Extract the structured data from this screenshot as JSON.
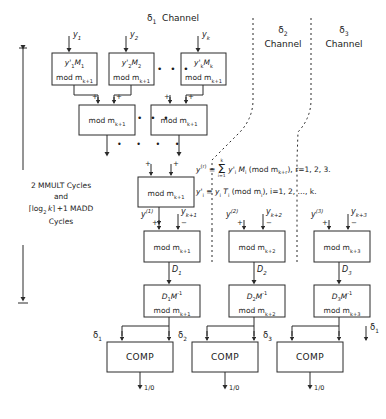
{
  "figure": {
    "type": "block-diagram",
    "headers": [
      {
        "name": "channel-1-header",
        "symbol": "δ",
        "sub": "1",
        "word": "Channel"
      },
      {
        "name": "channel-2-header",
        "symbol": "δ",
        "sub": "2",
        "word": "Channel"
      },
      {
        "name": "channel-3-header",
        "symbol": "δ",
        "sub": "3",
        "word": "Channel"
      }
    ],
    "inputs_top": [
      {
        "base": "y",
        "sub": "1"
      },
      {
        "base": "y",
        "sub": "2"
      },
      {
        "base": "y",
        "sub": "k"
      }
    ],
    "mmult_boxes": [
      {
        "line1_num": "y'",
        "line1_sub": "1",
        "line1_mul": "M",
        "line1_mulsub": "1",
        "line2": "mod m",
        "line2_sub": "k+1"
      },
      {
        "line1_num": "y'",
        "line1_sub": "2",
        "line1_mul": "M",
        "line1_mulsub": "2",
        "line2": "mod m",
        "line2_sub": "k+1"
      },
      {
        "line1_num": "y'",
        "line1_sub": "k",
        "line1_mul": "M",
        "line1_mulsub": "k",
        "line2": "mod m",
        "line2_sub": "k+1"
      }
    ],
    "adder_row2": [
      {
        "label": "mod m",
        "sub": "k+1"
      },
      {
        "label": "mod m",
        "sub": "k+1"
      }
    ],
    "adder_row3": {
      "label": "mod m",
      "sub": "k+1"
    },
    "subtract_boxes": [
      {
        "label": "mod m",
        "sub": "k+1"
      },
      {
        "label": "mod m",
        "sub": "k+2"
      },
      {
        "label": "mod m",
        "sub": "k+3"
      }
    ],
    "partial_sums": [
      {
        "base": "y",
        "sup": "(1)"
      },
      {
        "base": "y",
        "sup": "(2)"
      },
      {
        "base": "y",
        "sup": "(3)"
      }
    ],
    "redundant_inputs": [
      {
        "base": "y",
        "sub": "k+1"
      },
      {
        "base": "y",
        "sub": "k+2"
      },
      {
        "base": "y",
        "sub": "k+3"
      }
    ],
    "d_labels": [
      {
        "base": "D",
        "sub": "1"
      },
      {
        "base": "D",
        "sub": "2"
      },
      {
        "base": "D",
        "sub": "3"
      }
    ],
    "scale_boxes": [
      {
        "l1_d": "D",
        "l1_sub": "1",
        "l1_m": "M",
        "l1_sup": "-1",
        "l2": "mod m",
        "l2_sub": "k+1"
      },
      {
        "l1_d": "D",
        "l1_sub": "2",
        "l1_m": "M",
        "l1_sup": "-1",
        "l2": "mod m",
        "l2_sub": "k+2"
      },
      {
        "l1_d": "D",
        "l1_sub": "3",
        "l1_m": "M",
        "l1_sup": "-1",
        "l2": "mod m",
        "l2_sub": "k+3"
      }
    ],
    "delta_labels": [
      {
        "symbol": "δ",
        "sub": "1"
      },
      {
        "symbol": "δ",
        "sub": "2"
      },
      {
        "symbol": "δ",
        "sub": "3"
      },
      {
        "symbol": "δ",
        "sub": "1"
      }
    ],
    "comparators": [
      {
        "label": "COMP",
        "out": "1/0"
      },
      {
        "label": "COMP",
        "out": "1/0"
      },
      {
        "label": "COMP",
        "out": "1/0"
      }
    ],
    "timing_annotation": {
      "line1": "2 MMULT Cycles",
      "line2": "and",
      "line3_prefix": "log",
      "line3_sub": "2",
      "line3_var": "k",
      "line3_suffix": "+1 MADD",
      "line4": "Cycles"
    },
    "equations": [
      {
        "name": "equation-y-r",
        "lhs_base": "y",
        "lhs_sup": "(r)",
        "rel": "≡",
        "sum_top": "k",
        "sum_bottom": "i=1",
        "body_a": "y'",
        "body_a_sub": "i",
        "body_b": "M",
        "body_b_sub": "i",
        "mod_open": "(mod m",
        "mod_sub": "k+r",
        "mod_close": "),",
        "tail": "r=1, 2, 3."
      },
      {
        "name": "equation-y-prime",
        "lhs_base": "y'",
        "lhs_sub": "i",
        "rel": "≡",
        "body_a": "y",
        "body_a_sub": "i",
        "body_b": "T",
        "body_b_sub": "i",
        "mod_open": "(mod m",
        "mod_sub": "i",
        "mod_close": "),",
        "tail": "i=1, 2, …, k."
      }
    ],
    "op_plus": "+",
    "op_minus": "−",
    "ellipsis": "• • •",
    "ellipsis_wide": "•  •  •  •",
    "colors": {
      "ink": "#1a1a1a",
      "line": "#2b2b2b",
      "background": "#ffffff"
    }
  }
}
